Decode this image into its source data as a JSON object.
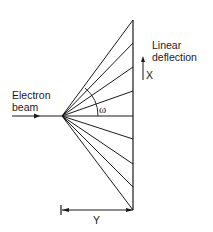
{
  "diagram": {
    "labels": {
      "beam_line1": "Electron",
      "beam_line2": "beam",
      "deflection_line1": "Linear",
      "deflection_line2": "deflection",
      "x_axis": "X",
      "y_axis": "Y",
      "angle": "ω"
    },
    "geometry": {
      "origin": [
        62,
        116
      ],
      "screen_x": 133,
      "screen_top": 20,
      "screen_bottom": 210,
      "ray_endpoints_y": [
        20,
        43,
        67,
        91,
        116,
        139,
        164,
        187,
        210
      ]
    },
    "colors": {
      "line": "#1a1a1a",
      "background": "#ffffff"
    }
  }
}
